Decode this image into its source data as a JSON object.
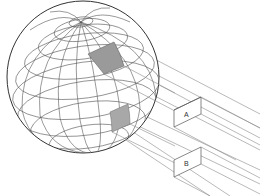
{
  "diagram": {
    "colors": {
      "background": "#ffffff",
      "grid_line": "#555555",
      "outline": "#333333",
      "patch_fill": "#9a9a9a",
      "ray_line": "#8a8a8a"
    },
    "sphere": {
      "cx": 83,
      "cy": 77,
      "r": 76
    },
    "patches": [
      {
        "id": "patch-upper",
        "target": "A"
      },
      {
        "id": "patch-lower",
        "target": "B"
      }
    ],
    "boxes": [
      {
        "id": "A",
        "label": "A"
      },
      {
        "id": "B",
        "label": "B"
      }
    ]
  }
}
